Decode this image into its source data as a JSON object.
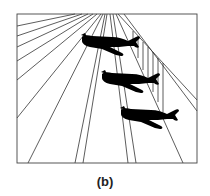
{
  "figure": {
    "caption": "(b)",
    "colors": {
      "line": "#333333",
      "plane": "#000000",
      "background": "#ffffff"
    },
    "frame": {
      "x": 17,
      "y": 14,
      "width": 180,
      "height": 149
    },
    "airplanes": [
      {
        "id": "plane-top",
        "x": 82,
        "y": 33
      },
      {
        "id": "plane-middle",
        "x": 102,
        "y": 70
      },
      {
        "id": "plane-bottom",
        "x": 121,
        "y": 106
      }
    ]
  }
}
